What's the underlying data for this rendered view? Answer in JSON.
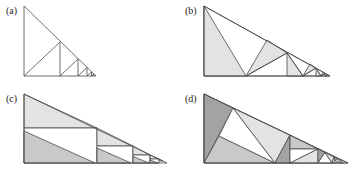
{
  "figure": {
    "type": "triangle-dissection-diagram",
    "colors": {
      "line": "#4a4a4a",
      "dark": "#a3a3a3",
      "medium": "#c9c9c9",
      "light": "#e3e3e3",
      "white": "#ffffff"
    },
    "panels": [
      {
        "id": "a",
        "label": "(a)"
      },
      {
        "id": "b",
        "label": "(b)"
      },
      {
        "id": "c",
        "label": "(c)"
      },
      {
        "id": "d",
        "label": "(d)"
      }
    ]
  }
}
